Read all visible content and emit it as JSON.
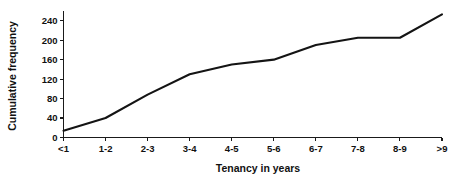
{
  "chart_data": {
    "type": "line",
    "title": "",
    "xlabel": "Tenancy in years",
    "ylabel": "Cumulative frequency",
    "categories": [
      "<1",
      "1-2",
      "2-3",
      "3-4",
      "4-5",
      "5-6",
      "6-7",
      "7-8",
      "8-9",
      ">9"
    ],
    "values": [
      14,
      40,
      88,
      130,
      150,
      160,
      190,
      205,
      205,
      253
    ],
    "yticks": [
      0,
      40,
      80,
      120,
      160,
      200,
      240
    ],
    "ytick_labels": [
      "0",
      "40",
      "80",
      "120",
      "160",
      "200",
      "240"
    ],
    "ylim": [
      0,
      260
    ],
    "xlim": [
      0,
      9
    ],
    "grid": false,
    "legend": false,
    "line_color": "#141414",
    "axis_color": "#1a1a1a",
    "background": "#ffffff"
  }
}
